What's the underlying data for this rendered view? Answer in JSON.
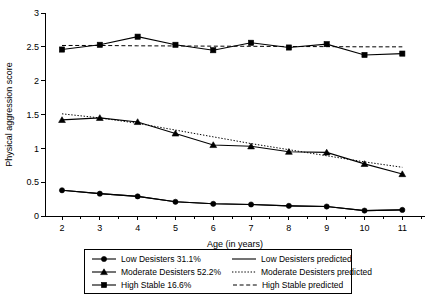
{
  "chart_data": {
    "type": "line",
    "title": "",
    "xlabel": "Age (in years)",
    "ylabel": "Physical aggression score",
    "x": [
      2,
      3,
      4,
      5,
      6,
      7,
      8,
      9,
      10,
      11
    ],
    "xticklabels": [
      "2",
      "3",
      "4",
      "5",
      "6",
      "7",
      "8",
      "9",
      "10",
      "11"
    ],
    "yticklabels": [
      "0",
      "0.5",
      "1",
      "1.5",
      "2",
      "2.5",
      "3"
    ],
    "yticks": [
      0,
      0.5,
      1,
      1.5,
      2,
      2.5,
      3
    ],
    "xlim": [
      1.55,
      11.6
    ],
    "ylim": [
      0,
      3
    ],
    "grid": false,
    "legend_position": "below-axes",
    "series": [
      {
        "name": "Low Desisters 31.1%",
        "marker": "circle",
        "linestyle": "solid",
        "values": [
          0.38,
          0.33,
          0.29,
          0.21,
          0.18,
          0.17,
          0.15,
          0.14,
          0.08,
          0.09
        ]
      },
      {
        "name": "Moderate Desisters 52.2%",
        "marker": "triangle",
        "linestyle": "solid",
        "values": [
          1.42,
          1.45,
          1.39,
          1.22,
          1.05,
          1.03,
          0.95,
          0.94,
          0.77,
          0.62
        ]
      },
      {
        "name": "High Stable 16.6%",
        "marker": "square",
        "linestyle": "solid",
        "values": [
          2.46,
          2.53,
          2.65,
          2.53,
          2.45,
          2.56,
          2.49,
          2.54,
          2.38,
          2.4
        ]
      },
      {
        "name": "Low Desisters predicted",
        "marker": "none",
        "linestyle": "solid",
        "values": [
          0.38,
          0.33,
          0.29,
          0.21,
          0.18,
          0.17,
          0.15,
          0.14,
          0.08,
          0.09
        ]
      },
      {
        "name": "Moderate Desisters predicted",
        "marker": "none",
        "linestyle": "dotted",
        "values": [
          1.51,
          1.45,
          1.37,
          1.27,
          1.17,
          1.07,
          0.98,
          0.89,
          0.8,
          0.72
        ]
      },
      {
        "name": "High Stable predicted",
        "marker": "none",
        "linestyle": "dashed",
        "values": [
          2.52,
          2.52,
          2.515,
          2.513,
          2.51,
          2.508,
          2.505,
          2.503,
          2.5,
          2.5
        ]
      }
    ]
  },
  "legend": {
    "rows": [
      {
        "left_label": "Low Desisters 31.1%",
        "left_marker": "circle",
        "left_linestyle": "solid",
        "right_label": "Low Desisters predicted",
        "right_marker": "none",
        "right_linestyle": "solid"
      },
      {
        "left_label": "Moderate Desisters 52.2%",
        "left_marker": "triangle",
        "left_linestyle": "solid",
        "right_label": "Moderate Desisters predicted",
        "right_marker": "none",
        "right_linestyle": "dotted"
      },
      {
        "left_label": "High Stable 16.6%",
        "left_marker": "square",
        "left_linestyle": "solid",
        "right_label": "High Stable predicted",
        "right_marker": "none",
        "right_linestyle": "dashed"
      }
    ]
  },
  "colors": {
    "ink": "#000000",
    "background": "#ffffff"
  }
}
